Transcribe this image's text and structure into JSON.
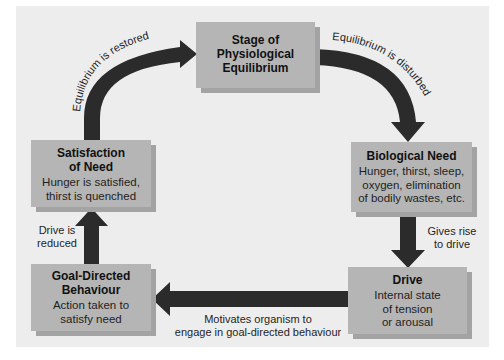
{
  "diagram": {
    "type": "cycle",
    "colors": {
      "background": "#ededed",
      "box_fill": "#b5b5b5",
      "box_shadow": "#a3a3a3",
      "arrow": "#2b2b2b",
      "text": "#1a1a1a"
    },
    "nodes": {
      "stage": {
        "title_lines": [
          "Stage of",
          "Physiological",
          "Equilibrium"
        ]
      },
      "biological_need": {
        "title": "Biological Need",
        "desc_lines": [
          "Hunger, thirst, sleep,",
          "oxygen, elimination",
          "of bodily wastes, etc."
        ]
      },
      "drive": {
        "title": "Drive",
        "desc_lines": [
          "Internal state",
          "of tension",
          "or arousal"
        ]
      },
      "goal_directed": {
        "title_lines": [
          "Goal-Directed",
          "Behaviour"
        ],
        "desc_lines": [
          "Action taken to",
          "satisfy need"
        ]
      },
      "satisfaction": {
        "title_lines": [
          "Satisfaction",
          "of Need"
        ],
        "desc_lines": [
          "Hunger is satisfied,",
          "thirst is quenched"
        ]
      }
    },
    "edges": {
      "stage_to_need": {
        "label": "Equilibrium is disturbed"
      },
      "need_to_drive": {
        "label_lines": [
          "Gives rise",
          "to drive"
        ]
      },
      "drive_to_goal": {
        "label_lines": [
          "Motivates organism to",
          "engage in goal-directed behaviour"
        ]
      },
      "goal_to_satisfaction": {
        "label_lines": [
          "Drive is",
          "reduced"
        ]
      },
      "satisfaction_to_stage": {
        "label": "Equilibrium is restored"
      }
    }
  }
}
